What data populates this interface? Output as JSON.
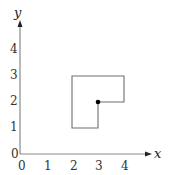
{
  "diagram": {
    "axes": {
      "x_label": "x",
      "y_label": "y",
      "x_ticks": [
        "0",
        "1",
        "2",
        "3",
        "4"
      ],
      "y_ticks": [
        "0",
        "1",
        "2",
        "3",
        "4"
      ],
      "origin_label": "0"
    },
    "shape": {
      "type": "L-shaped polygon",
      "vertices": [
        [
          2,
          1
        ],
        [
          3,
          1
        ],
        [
          3,
          2
        ],
        [
          4,
          2
        ],
        [
          4,
          3
        ],
        [
          2,
          3
        ]
      ]
    },
    "point": {
      "x": 3,
      "y": 2
    },
    "colors": {
      "axis": "#8a8a8a",
      "shape": "#6e6e6e",
      "point": "#000000",
      "text": "#333333"
    }
  }
}
